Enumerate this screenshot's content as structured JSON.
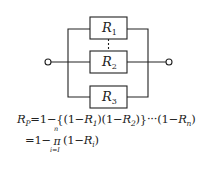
{
  "diagram": {
    "type": "parallel-reliability-block-diagram",
    "components": [
      {
        "id": "R1",
        "label_main": "R",
        "label_sub": "1"
      },
      {
        "id": "R2",
        "label_main": "R",
        "label_sub": "2"
      },
      {
        "id": "R3",
        "label_main": "R",
        "label_sub": "3"
      }
    ],
    "connector_between_R1_R2": "dashed",
    "terminals": [
      "left-terminal",
      "right-terminal"
    ],
    "line_color": "#222222"
  },
  "formula": {
    "line1": {
      "lhs_main": "R",
      "lhs_sub": "P",
      "t1": "=1−{(1−",
      "r1_main": "R",
      "r1_sub": "1",
      "t2": ")(1−",
      "r2_main": "R",
      "r2_sub": "2",
      "t3": ")}···(1−",
      "rn_main": "R",
      "rn_sub": "n",
      "t4": ")"
    },
    "line2": {
      "t1": "=1−",
      "pi_symbol": "π",
      "pi_upper": "n",
      "pi_lower": "i=I",
      "t2": "(1−",
      "ri_main": "R",
      "ri_sub": "i",
      "t3": ")"
    }
  }
}
